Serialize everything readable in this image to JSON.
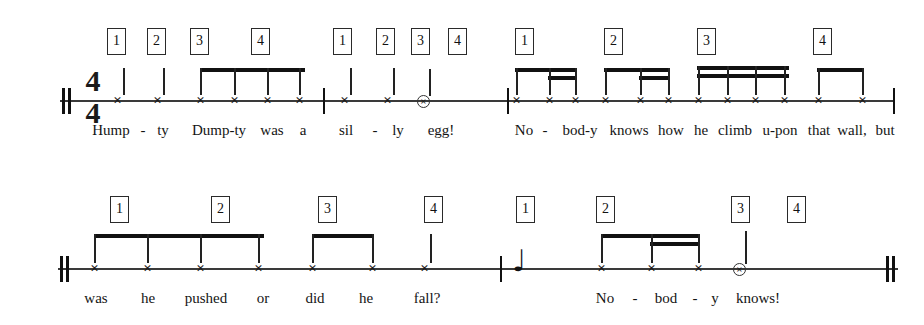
{
  "document": {
    "kind": "rhythm-notation-worksheet",
    "title": "Humpty Dumpty rhythm chant"
  },
  "notation": {
    "time_signature": {
      "numerator": "4",
      "denominator": "4"
    },
    "beat_labels": [
      "1",
      "2",
      "3",
      "4"
    ],
    "notehead_glyph": "×",
    "quarter_rest_glyph": "♩",
    "systems": [
      {
        "name": "system-1",
        "staff": {
          "x": 60,
          "y": 100,
          "width": 835
        },
        "start_barline": "heavy-double",
        "end_barline": "thin",
        "measures": [
          {
            "name": "measure-1",
            "beats": [
              {
                "label": "1",
                "box_x": 107,
                "notes": [
                  {
                    "x": 118,
                    "type": "quarter"
                  }
                ]
              },
              {
                "label": "2",
                "box_x": 147,
                "notes": [
                  {
                    "x": 158,
                    "type": "quarter"
                  }
                ]
              },
              {
                "label": "3",
                "box_x": 190,
                "notes": [
                  {
                    "x": 201,
                    "type": "eighth"
                  },
                  {
                    "x": 232,
                    "type": "eighth"
                  }
                ]
              },
              {
                "label": "4",
                "box_x": 251,
                "notes": [
                  {
                    "x": 262,
                    "type": "eighth"
                  },
                  {
                    "x": 294,
                    "type": "eighth"
                  }
                ]
              }
            ],
            "lyrics": [
              {
                "text": "Hump",
                "x": 111
              },
              {
                "text": "-",
                "x": 143
              },
              {
                "text": "ty",
                "x": 163
              },
              {
                "text": "Dump-ty",
                "x": 219
              },
              {
                "text": "was",
                "x": 272
              },
              {
                "text": "a",
                "x": 303
              }
            ]
          },
          {
            "name": "measure-1b",
            "beats": [
              {
                "label": "1",
                "box_x": 333,
                "notes": [
                  {
                    "x": 344,
                    "type": "quarter"
                  }
                ]
              },
              {
                "label": "2",
                "box_x": 376,
                "notes": [
                  {
                    "x": 387,
                    "type": "quarter"
                  }
                ]
              },
              {
                "label": "3",
                "box_x": 411,
                "notes": [
                  {
                    "x": 421,
                    "type": "half"
                  }
                ]
              },
              {
                "label": "4",
                "box_x": 448,
                "notes": []
              }
            ],
            "lyrics": [
              {
                "text": "sil",
                "x": 346
              },
              {
                "text": "-",
                "x": 375
              },
              {
                "text": "ly",
                "x": 398
              },
              {
                "text": "egg!",
                "x": 441
              }
            ]
          },
          {
            "name": "measure-2",
            "beats": [
              {
                "label": "1",
                "box_x": 515,
                "notes": [
                  {
                    "x": 516,
                    "type": "eighth"
                  },
                  {
                    "x": 549,
                    "type": "sixteenth"
                  },
                  {
                    "x": 572,
                    "type": "sixteenth"
                  }
                ]
              },
              {
                "label": "2",
                "box_x": 604,
                "notes": [
                  {
                    "x": 605,
                    "type": "eighth"
                  },
                  {
                    "x": 640,
                    "type": "sixteenth"
                  },
                  {
                    "x": 665,
                    "type": "sixteenth"
                  }
                ]
              },
              {
                "label": "3",
                "box_x": 697,
                "notes": [
                  {
                    "x": 698,
                    "type": "sixteenth"
                  },
                  {
                    "x": 727,
                    "type": "sixteenth"
                  },
                  {
                    "x": 755,
                    "type": "sixteenth"
                  },
                  {
                    "x": 783,
                    "type": "sixteenth"
                  }
                ]
              },
              {
                "label": "4",
                "box_x": 813,
                "notes": [
                  {
                    "x": 815,
                    "type": "eighth"
                  },
                  {
                    "x": 855,
                    "type": "eighth"
                  }
                ]
              }
            ],
            "lyrics": [
              {
                "text": "No",
                "x": 524
              },
              {
                "text": "-",
                "x": 545
              },
              {
                "text": "bod-y",
                "x": 580
              },
              {
                "text": "knows",
                "x": 628
              },
              {
                "text": "how",
                "x": 670
              },
              {
                "text": "he",
                "x": 700
              },
              {
                "text": "climb",
                "x": 734
              },
              {
                "text": "u-pon",
                "x": 779
              },
              {
                "text": "that",
                "x": 818
              },
              {
                "text": "wall,",
                "x": 851
              },
              {
                "text": "but",
                "x": 884
              }
            ]
          }
        ]
      },
      {
        "name": "system-2",
        "staff": {
          "x": 58,
          "y": 268,
          "width": 840
        },
        "start_barline": "heavy-double",
        "end_barline": "heavy-double",
        "measures": [
          {
            "name": "measure-3",
            "beats": [
              {
                "label": "1",
                "box_x": 110,
                "notes": [
                  {
                    "x": 91,
                    "type": "eighth"
                  },
                  {
                    "x": 143,
                    "type": "eighth"
                  }
                ]
              },
              {
                "label": "2",
                "box_x": 211,
                "notes": [
                  {
                    "x": 196,
                    "type": "eighth"
                  },
                  {
                    "x": 251,
                    "type": "eighth"
                  }
                ]
              },
              {
                "label": "3",
                "box_x": 318,
                "notes": [
                  {
                    "x": 308,
                    "type": "eighth"
                  },
                  {
                    "x": 362,
                    "type": "eighth"
                  }
                ]
              },
              {
                "label": "4",
                "box_x": 424,
                "notes": [
                  {
                    "x": 424,
                    "type": "quarter"
                  }
                ]
              }
            ],
            "lyrics": [
              {
                "text": "was",
                "x": 96
              },
              {
                "text": "he",
                "x": 148
              },
              {
                "text": "pushed",
                "x": 205
              },
              {
                "text": "or",
                "x": 263
              },
              {
                "text": "did",
                "x": 315
              },
              {
                "text": "he",
                "x": 366
              },
              {
                "text": "fall?",
                "x": 426
              }
            ]
          },
          {
            "name": "measure-4",
            "beats": [
              {
                "label": "1",
                "box_x": 516,
                "notes": [],
                "rest": {
                  "x": 516,
                  "type": "quarter-rest"
                }
              },
              {
                "label": "2",
                "box_x": 596,
                "notes": [
                  {
                    "x": 598,
                    "type": "eighth"
                  },
                  {
                    "x": 652,
                    "type": "sixteenth"
                  },
                  {
                    "x": 695,
                    "type": "sixteenth"
                  }
                ]
              },
              {
                "label": "3",
                "box_x": 731,
                "notes": [
                  {
                    "x": 737,
                    "type": "half"
                  }
                ]
              },
              {
                "label": "4",
                "box_x": 787,
                "notes": []
              }
            ],
            "lyrics": [
              {
                "text": "No",
                "x": 604
              },
              {
                "text": "-",
                "x": 634
              },
              {
                "text": "bod",
                "x": 665
              },
              {
                "text": "-",
                "x": 694
              },
              {
                "text": "y",
                "x": 714
              },
              {
                "text": "knows!",
                "x": 757
              }
            ]
          }
        ]
      }
    ]
  },
  "colors": {
    "ink": "#1a1a1a",
    "staff": "#3a3a3a",
    "paper": "#ffffff"
  }
}
